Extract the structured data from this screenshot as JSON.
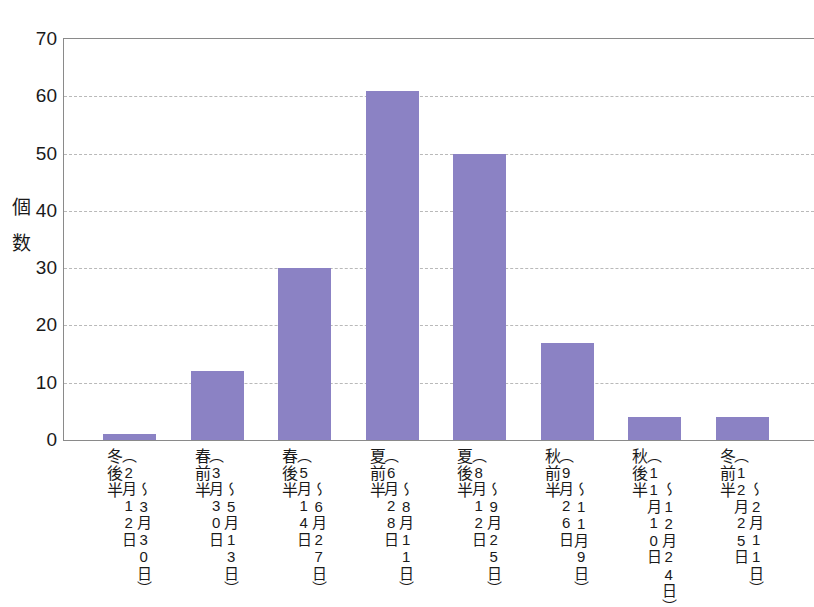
{
  "chart_data": {
    "type": "bar",
    "title": "",
    "xlabel": "",
    "ylabel": "個数",
    "ylim": [
      0,
      70
    ],
    "yticks": [
      0,
      10,
      20,
      30,
      40,
      50,
      60,
      70
    ],
    "grid": true,
    "legend": "none",
    "bar_color": "#8b82c4",
    "categories": [
      "冬後半（2月12日〜3月30日）",
      "春前半（3月30日〜5月13日）",
      "春後半（5月14日〜6月27日）",
      "夏前半（6月28日〜8月11日）",
      "夏後半（8月12日〜9月25日）",
      "秋前半（9月26日〜11月9日）",
      "秋後半（11月10日〜12月24日）",
      "冬前半（12月25日〜2月11日）"
    ],
    "values": [
      1,
      12,
      30,
      61,
      50,
      17,
      4,
      4
    ],
    "category_parts": [
      {
        "season": "冬後半",
        "range_a": "（2月12日",
        "range_b": "〜3月30日）",
        "value": 1
      },
      {
        "season": "春前半",
        "range_a": "（3月30日",
        "range_b": "〜5月13日）",
        "value": 12
      },
      {
        "season": "春後半",
        "range_a": "（5月14日",
        "range_b": "〜6月27日）",
        "value": 30
      },
      {
        "season": "夏前半",
        "range_a": "（6月28日",
        "range_b": "〜8月11日）",
        "value": 61
      },
      {
        "season": "夏後半",
        "range_a": "（8月12日",
        "range_b": "〜9月25日）",
        "value": 50
      },
      {
        "season": "秋前半",
        "range_a": "（9月26日",
        "range_b": "〜11月9日）",
        "value": 17
      },
      {
        "season": "秋後半",
        "range_a": "（11月10日",
        "range_b": "〜12月24日）",
        "value": 4
      },
      {
        "season": "冬前半",
        "range_a": "（12月25日",
        "range_b": "〜2月11日）",
        "value": 4
      }
    ]
  },
  "axis": {
    "y_title_text": "個\n数",
    "tick_labels": [
      "0",
      "10",
      "20",
      "30",
      "40",
      "50",
      "60",
      "70"
    ]
  }
}
